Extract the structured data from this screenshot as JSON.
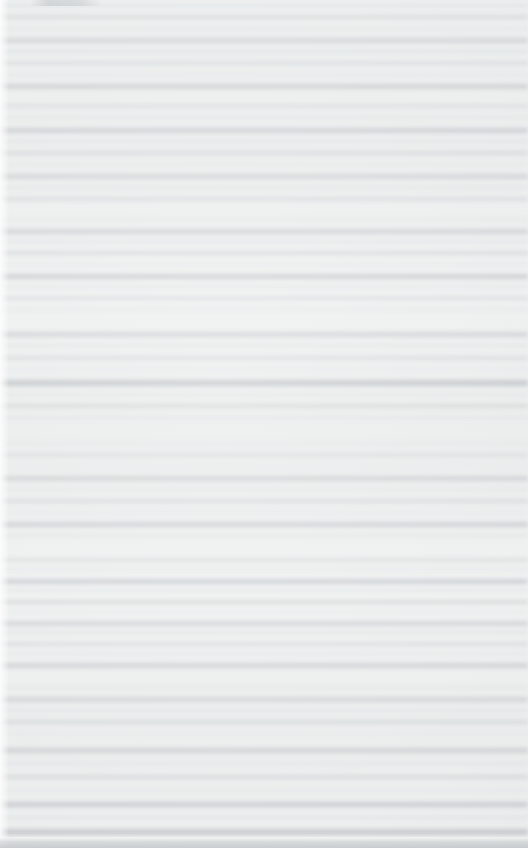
{
  "capture": {
    "width": 528,
    "height": 848,
    "legible_text": false,
    "condition": "heavily-blurred",
    "description": "Out-of-focus capture of a text document page. No glyphs are resolvable at any zoom level; content reads only as horizontal tonal bands corresponding to lines of body text."
  },
  "palette": {
    "page_base": "#eef0f0",
    "line_light": "#f2f2f2",
    "line_mid": "#e3e3e3",
    "line_dark": "#c9ccce",
    "line_darkest": "#bcc0c3",
    "margin_highlight": "#ffffff",
    "bottom_edge": "#babec1"
  },
  "layout": {
    "left_margin_px": 9,
    "bottom_edge_px": 11,
    "text_spans_full_width": true,
    "mean_line_pitch_px": 11.5
  },
  "top_mark": {
    "present": true,
    "x": 30,
    "y": 0,
    "width": 72,
    "height": 6,
    "note": "faint residual smudge, too degraded to resolve"
  },
  "blocks": [
    {
      "name": "block-1",
      "top": 4,
      "line_pitch": 11.5,
      "lines": [
        {
          "y": 0,
          "h": 3,
          "tone": "#d9dcde",
          "a": 0.55
        },
        {
          "y": 11,
          "h": 4,
          "tone": "#cfd2d4",
          "a": 0.62
        },
        {
          "y": 23,
          "h": 3,
          "tone": "#dcdfe1",
          "a": 0.5
        },
        {
          "y": 34,
          "h": 5,
          "tone": "#c9ccce",
          "a": 0.7
        },
        {
          "y": 46,
          "h": 3,
          "tone": "#d5d8da",
          "a": 0.52
        },
        {
          "y": 57,
          "h": 4,
          "tone": "#d0d3d5",
          "a": 0.6
        },
        {
          "y": 69,
          "h": 3,
          "tone": "#dde0e2",
          "a": 0.46
        },
        {
          "y": 80,
          "h": 5,
          "tone": "#c6c9cb",
          "a": 0.72
        }
      ]
    },
    {
      "name": "block-2",
      "top": 104,
      "line_pitch": 11.8,
      "lines": [
        {
          "y": 0,
          "h": 4,
          "tone": "#d2d5d7",
          "a": 0.58
        },
        {
          "y": 12,
          "h": 3,
          "tone": "#dadde0",
          "a": 0.48
        },
        {
          "y": 24,
          "h": 5,
          "tone": "#c4c7ca",
          "a": 0.74
        },
        {
          "y": 36,
          "h": 3,
          "tone": "#d8dbdd",
          "a": 0.5
        },
        {
          "y": 47,
          "h": 4,
          "tone": "#cdd0d2",
          "a": 0.64
        },
        {
          "y": 59,
          "h": 3,
          "tone": "#dfe2e4",
          "a": 0.44
        },
        {
          "y": 70,
          "h": 5,
          "tone": "#c8cbcd",
          "a": 0.7
        },
        {
          "y": 82,
          "h": 3,
          "tone": "#d6d9db",
          "a": 0.52
        },
        {
          "y": 93,
          "h": 4,
          "tone": "#ced1d3",
          "a": 0.62
        }
      ]
    },
    {
      "name": "block-3",
      "top": 218,
      "line_pitch": 11.2,
      "lines": [
        {
          "y": 0,
          "h": 3,
          "tone": "#dbdee0",
          "a": 0.47
        },
        {
          "y": 11,
          "h": 5,
          "tone": "#c5c8cb",
          "a": 0.73
        },
        {
          "y": 22,
          "h": 3,
          "tone": "#d7dadc",
          "a": 0.51
        },
        {
          "y": 33,
          "h": 4,
          "tone": "#ccd0d2",
          "a": 0.65
        },
        {
          "y": 45,
          "h": 3,
          "tone": "#dee1e3",
          "a": 0.45
        },
        {
          "y": 56,
          "h": 5,
          "tone": "#c2c5c8",
          "a": 0.76
        },
        {
          "y": 67,
          "h": 3,
          "tone": "#d9dcde",
          "a": 0.49
        },
        {
          "y": 78,
          "h": 4,
          "tone": "#d0d3d5",
          "a": 0.6
        },
        {
          "y": 90,
          "h": 3,
          "tone": "#dcdfe1",
          "a": 0.46
        }
      ]
    },
    {
      "name": "block-4",
      "top": 332,
      "line_pitch": 12.0,
      "lines": [
        {
          "y": 0,
          "h": 5,
          "tone": "#c7cacd",
          "a": 0.71
        },
        {
          "y": 12,
          "h": 3,
          "tone": "#d8dbdd",
          "a": 0.5
        },
        {
          "y": 24,
          "h": 4,
          "tone": "#cfd2d4",
          "a": 0.62
        },
        {
          "y": 36,
          "h": 3,
          "tone": "#e0e3e5",
          "a": 0.42
        },
        {
          "y": 48,
          "h": 6,
          "tone": "#bcc0c3",
          "a": 0.8
        },
        {
          "y": 61,
          "h": 3,
          "tone": "#dadde0",
          "a": 0.48
        },
        {
          "y": 72,
          "h": 4,
          "tone": "#cbcecf",
          "a": 0.66
        },
        {
          "y": 84,
          "h": 3,
          "tone": "#d7dadc",
          "a": 0.51
        }
      ]
    },
    {
      "name": "block-5",
      "top": 442,
      "line_pitch": 11.6,
      "lines": [
        {
          "y": 0,
          "h": 3,
          "tone": "#dde0e2",
          "a": 0.45
        },
        {
          "y": 11,
          "h": 4,
          "tone": "#d1d4d6",
          "a": 0.59
        },
        {
          "y": 23,
          "h": 3,
          "tone": "#e1e4e6",
          "a": 0.4
        },
        {
          "y": 34,
          "h": 5,
          "tone": "#c6c9cb",
          "a": 0.72
        },
        {
          "y": 46,
          "h": 3,
          "tone": "#d9dcde",
          "a": 0.48
        },
        {
          "y": 57,
          "h": 4,
          "tone": "#cdd0d2",
          "a": 0.64
        },
        {
          "y": 69,
          "h": 3,
          "tone": "#dfe2e4",
          "a": 0.43
        },
        {
          "y": 80,
          "h": 5,
          "tone": "#c4c7ca",
          "a": 0.74
        },
        {
          "y": 92,
          "h": 3,
          "tone": "#d6d9db",
          "a": 0.52
        }
      ]
    },
    {
      "name": "block-6",
      "top": 558,
      "line_pitch": 10.4,
      "lines": [
        {
          "y": 0,
          "h": 4,
          "tone": "#d0d3d5",
          "a": 0.6
        },
        {
          "y": 10,
          "h": 3,
          "tone": "#dcdfe1",
          "a": 0.46
        },
        {
          "y": 21,
          "h": 5,
          "tone": "#c3c6c9",
          "a": 0.75
        },
        {
          "y": 31,
          "h": 3,
          "tone": "#d8dbdd",
          "a": 0.5
        },
        {
          "y": 42,
          "h": 4,
          "tone": "#cbcecf",
          "a": 0.66
        },
        {
          "y": 52,
          "h": 3,
          "tone": "#e0e3e5",
          "a": 0.41
        },
        {
          "y": 63,
          "h": 5,
          "tone": "#c7cacd",
          "a": 0.7
        },
        {
          "y": 73,
          "h": 3,
          "tone": "#d5d8da",
          "a": 0.53
        },
        {
          "y": 84,
          "h": 4,
          "tone": "#cfd2d4",
          "a": 0.61
        },
        {
          "y": 94,
          "h": 3,
          "tone": "#dbdee0",
          "a": 0.47
        },
        {
          "y": 105,
          "h": 5,
          "tone": "#c5c8cb",
          "a": 0.73
        }
      ]
    },
    {
      "name": "block-7",
      "top": 686,
      "line_pitch": 11.4,
      "lines": [
        {
          "y": 0,
          "h": 3,
          "tone": "#dadde0",
          "a": 0.48
        },
        {
          "y": 11,
          "h": 5,
          "tone": "#c8cbcd",
          "a": 0.69
        },
        {
          "y": 23,
          "h": 3,
          "tone": "#d7dadc",
          "a": 0.51
        },
        {
          "y": 34,
          "h": 4,
          "tone": "#ced1d3",
          "a": 0.63
        },
        {
          "y": 46,
          "h": 3,
          "tone": "#e1e4e6",
          "a": 0.4
        }
      ]
    },
    {
      "name": "block-8",
      "top": 748,
      "line_pitch": 13.0,
      "lines": [
        {
          "y": 0,
          "h": 5,
          "tone": "#c6c9cb",
          "a": 0.72
        },
        {
          "y": 14,
          "h": 3,
          "tone": "#d9dcde",
          "a": 0.49
        },
        {
          "y": 27,
          "h": 4,
          "tone": "#cdd0d2",
          "a": 0.64
        },
        {
          "y": 41,
          "h": 3,
          "tone": "#dee1e3",
          "a": 0.44
        },
        {
          "y": 54,
          "h": 5,
          "tone": "#c2c5c8",
          "a": 0.77
        },
        {
          "y": 68,
          "h": 3,
          "tone": "#d8dbdd",
          "a": 0.5
        },
        {
          "y": 81,
          "h": 6,
          "tone": "#bfc3c6",
          "a": 0.78
        }
      ]
    }
  ]
}
